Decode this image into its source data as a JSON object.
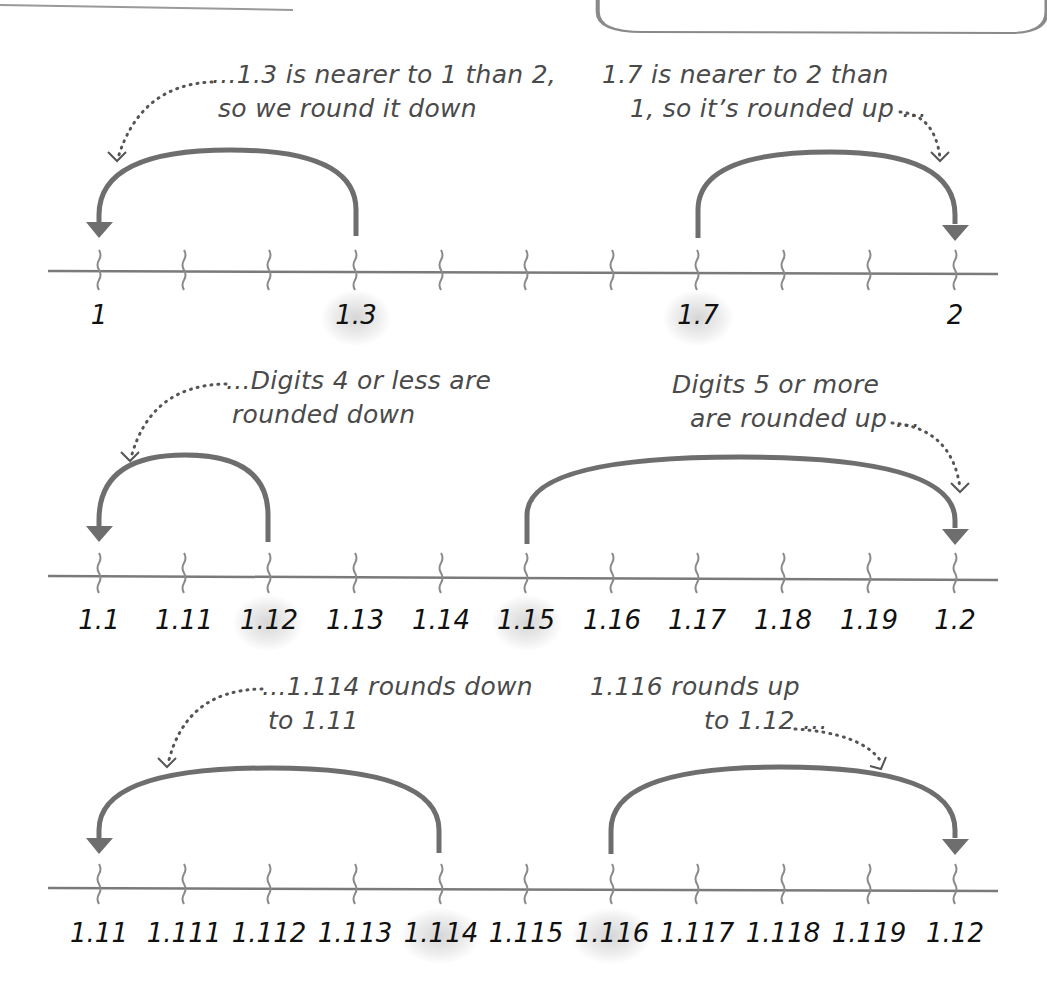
{
  "colors": {
    "line": "#7a7a7a",
    "arc": "#6e6e6e",
    "text": "#111111",
    "note": "#4a4a4a",
    "highlight": "#d8d8d8"
  },
  "header": {
    "rule": "top-left horizontal rule",
    "box": "empty rounded box top-right"
  },
  "rows": [
    {
      "id": "tenths",
      "labels": [
        "1",
        "",
        "",
        "1.3",
        "",
        "",
        "",
        "1.7",
        "",
        "",
        "2"
      ],
      "highlighted": [
        "1.3",
        "1.7"
      ],
      "notes": {
        "left": [
          "...1.3 is nearer to 1 than 2,",
          "so we round it down"
        ],
        "right": [
          "1.7 is nearer to 2 than",
          "1, so it’s rounded up ..."
        ]
      },
      "arcs": [
        {
          "from": "1.3",
          "to": "1",
          "direction": "down"
        },
        {
          "from": "1.7",
          "to": "2",
          "direction": "up"
        }
      ]
    },
    {
      "id": "hundredths",
      "labels": [
        "1.1",
        "1.11",
        "1.12",
        "1.13",
        "1.14",
        "1.15",
        "1.16",
        "1.17",
        "1.18",
        "1.19",
        "1.2"
      ],
      "highlighted": [
        "1.12",
        "1.15"
      ],
      "notes": {
        "left": [
          "...Digits 4 or less are",
          "rounded down"
        ],
        "right": [
          "Digits 5 or more",
          "are rounded up ..."
        ]
      },
      "arcs": [
        {
          "from": "1.12",
          "to": "1.1",
          "direction": "down"
        },
        {
          "from": "1.15",
          "to": "1.2",
          "direction": "up"
        }
      ]
    },
    {
      "id": "thousandths",
      "labels": [
        "1.11",
        "1.111",
        "1.112",
        "1.113",
        "1.114",
        "1.115",
        "1.116",
        "1.117",
        "1.118",
        "1.119",
        "1.12"
      ],
      "highlighted": [
        "1.114",
        "1.116"
      ],
      "notes": {
        "left": [
          "...1.114 rounds down",
          "to 1.11"
        ],
        "right": [
          "1.116 rounds up",
          "to 1.12 ..."
        ]
      },
      "arcs": [
        {
          "from": "1.114",
          "to": "1.11",
          "direction": "down"
        },
        {
          "from": "1.116",
          "to": "1.12",
          "direction": "up"
        }
      ]
    }
  ]
}
